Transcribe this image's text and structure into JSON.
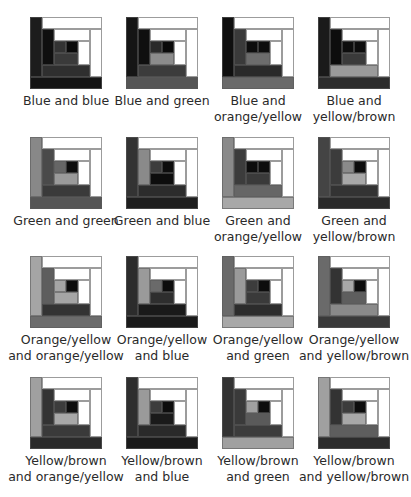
{
  "palette": {
    "white": "#ffffff",
    "black": "#0d0d0d",
    "blue_dark": "#1a1a1a",
    "blue_mid": "#2e2e2e",
    "blue_inner": "#3a3a3a",
    "green_light": "#8a8a8a",
    "green_mid": "#4a4a4a",
    "green_dark": "#3c3c3c",
    "orange_light": "#a8a8a8",
    "orange_mid": "#6e6e6e",
    "yellowbrown_dark": "#2f2f2f",
    "yellowbrown_mid": "#5a5a5a"
  },
  "blocks": [
    {
      "label_line1": "Blue and blue",
      "label_line2": "",
      "colors": {
        "L1": "#1c1c1c",
        "B1": "#141414",
        "L2": "#0f0f0f",
        "B2": "#2f2f2f",
        "c1": "#333333",
        "c2": "#0a0a0a",
        "c3": "#3a3a3a"
      }
    },
    {
      "label_line1": "Blue and green",
      "label_line2": "",
      "colors": {
        "L1": "#151515",
        "B1": "#555555",
        "L2": "#0f0f0f",
        "B2": "#3c3c3c",
        "c1": "#2a2a2a",
        "c2": "#0a0a0a",
        "c3": "#8c8c8c"
      }
    },
    {
      "label_line1": "Blue and",
      "label_line2": "orange/yellow",
      "colors": {
        "L1": "#0f0f0f",
        "B1": "#6a6a6a",
        "L2": "#3a3a3a",
        "B2": "#2a2a2a",
        "c1": "#0d0d0d",
        "c2": "#0d0d0d",
        "c3": "#6c6c6c"
      }
    },
    {
      "label_line1": "Blue and",
      "label_line2": "yellow/brown",
      "colors": {
        "L1": "#1a1a1a",
        "B1": "#2c2c2c",
        "L2": "#0d0d0d",
        "B2": "#9a9a9a",
        "c1": "#0d0d0d",
        "c2": "#0d0d0d",
        "c3": "#3a3a3a"
      }
    },
    {
      "label_line1": "Green and green",
      "label_line2": "",
      "colors": {
        "L1": "#888888",
        "B1": "#555555",
        "L2": "#4a4a4a",
        "B2": "#3a3a3a",
        "c1": "#666666",
        "c2": "#0d0d0d",
        "c3": "#9a9a9a"
      }
    },
    {
      "label_line1": "Green and blue",
      "label_line2": "",
      "colors": {
        "L1": "#333333",
        "B1": "#1e1e1e",
        "L2": "#8a8a8a",
        "B2": "#2c2c2c",
        "c1": "#3c3c3c",
        "c2": "#0d0d0d",
        "c3": "#0d0d0d"
      }
    },
    {
      "label_line1": "Green and",
      "label_line2": "orange/yellow",
      "colors": {
        "L1": "#8a8a8a",
        "B1": "#a8a8a8",
        "L2": "#3c3c3c",
        "B2": "#666666",
        "c1": "#0d0d0d",
        "c2": "#0d0d0d",
        "c3": "#3a3a3a"
      }
    },
    {
      "label_line1": "Green and",
      "label_line2": "yellow/brown",
      "colors": {
        "L1": "#444444",
        "B1": "#2a2a2a",
        "L2": "#3c3c3c",
        "B2": "#333333",
        "c1": "#8a8a8a",
        "c2": "#0d0d0d",
        "c3": "#a8a8a8"
      }
    },
    {
      "label_line1": "Orange/yellow",
      "label_line2": "and orange/yellow",
      "colors": {
        "L1": "#a5a5a5",
        "B1": "#6c6c6c",
        "L2": "#5e5e5e",
        "B2": "#333333",
        "c1": "#a5a5a5",
        "c2": "#0d0d0d",
        "c3": "#a5a5a5"
      }
    },
    {
      "label_line1": "Orange/yellow",
      "label_line2": "and blue",
      "colors": {
        "L1": "#2c2c2c",
        "B1": "#1a1a1a",
        "L2": "#9a9a9a",
        "B2": "#1a1a1a",
        "c1": "#6a6a6a",
        "c2": "#0d0d0d",
        "c3": "#2e2e2e"
      }
    },
    {
      "label_line1": "Orange/yellow",
      "label_line2": "and green",
      "colors": {
        "L1": "#6a6a6a",
        "B1": "#a8a8a8",
        "L2": "#9a9a9a",
        "B2": "#2c2c2c",
        "c1": "#3c3c3c",
        "c2": "#0d0d0d",
        "c3": "#3a3a3a"
      }
    },
    {
      "label_line1": "Orange/yellow",
      "label_line2": "and yellow/brown",
      "colors": {
        "L1": "#6a6a6a",
        "B1": "#3a3a3a",
        "L2": "#333333",
        "B2": "#8a8a8a",
        "c1": "#a8a8a8",
        "c2": "#0d0d0d",
        "c3": "#5e5e5e"
      }
    },
    {
      "label_line1": "Yellow/brown",
      "label_line2": "and orange/yellow",
      "colors": {
        "L1": "#a0a0a0",
        "B1": "#2a2a2a",
        "L2": "#333333",
        "B2": "#3a3a3a",
        "c1": "#3c3c3c",
        "c2": "#0d0d0d",
        "c3": "#a8a8a8"
      }
    },
    {
      "label_line1": "Yellow/brown",
      "label_line2": "and blue",
      "colors": {
        "L1": "#2e2e2e",
        "B1": "#1a1a1a",
        "L2": "#9a9a9a",
        "B2": "#2a2a2a",
        "c1": "#3c3c3c",
        "c2": "#0d0d0d",
        "c3": "#1a1a1a"
      }
    },
    {
      "label_line1": "Yellow/brown",
      "label_line2": "and green",
      "colors": {
        "L1": "#333333",
        "B1": "#a0a0a0",
        "L2": "#3a3a3a",
        "B2": "#3c3c3c",
        "c1": "#a0a0a0",
        "c2": "#0d0d0d",
        "c3": "#5a5a5a"
      }
    },
    {
      "label_line1": "Yellow/brown",
      "label_line2": "and yellow/brown",
      "colors": {
        "L1": "#a0a0a0",
        "B1": "#2c2c2c",
        "L2": "#333333",
        "B2": "#5e5e5e",
        "c1": "#3c3c3c",
        "c2": "#0d0d0d",
        "c3": "#a8a8a8"
      }
    }
  ]
}
